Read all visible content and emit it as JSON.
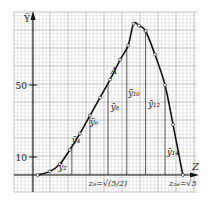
{
  "chart_data": {
    "type": "line",
    "title": "",
    "xlabel": "Z",
    "ylabel": "Ȳ",
    "xlim": [
      -0.28,
      2.45
    ],
    "ylim": [
      -10,
      90
    ],
    "y_ticks": [
      {
        "value": 10,
        "label": "10"
      },
      {
        "value": 50,
        "label": "50"
      }
    ],
    "grid": true,
    "series": [
      {
        "name": "curve",
        "x": [
          0.07,
          0.25,
          0.4,
          0.55,
          0.7,
          0.85,
          1.0,
          1.15,
          1.3,
          1.42,
          1.5,
          1.58,
          1.68,
          1.82,
          1.97,
          2.09,
          2.236
        ],
        "y": [
          0,
          2,
          6,
          14,
          23,
          33,
          43,
          53,
          64,
          72,
          84,
          83,
          80,
          67,
          50,
          28,
          0
        ]
      }
    ],
    "vertical_lines_x": [
      0.58,
      0.85,
      1.12,
      1.4,
      1.68,
      1.97
    ],
    "annotations": [
      {
        "text": "ȳ₂",
        "x": 0.38,
        "y": 3
      },
      {
        "text": "ȳ₄",
        "x": 0.58,
        "y": 18
      },
      {
        "text": "ȳ₆",
        "x": 0.85,
        "y": 28
      },
      {
        "text": "ȳ₈",
        "x": 1.16,
        "y": 36
      },
      {
        "text": "ȳ₁₀",
        "x": 1.42,
        "y": 44
      },
      {
        "text": "ȳ₁₂",
        "x": 1.72,
        "y": 38
      },
      {
        "text": "ȳ₁₄",
        "x": 2.0,
        "y": 11
      },
      {
        "text": "A",
        "x": 1.16,
        "y": 56
      },
      {
        "text": "z₈=√(5/2)",
        "x": 1.12,
        "y": -6
      },
      {
        "text": "z₁₆=√5",
        "x": 2.236,
        "y": -6
      }
    ]
  }
}
